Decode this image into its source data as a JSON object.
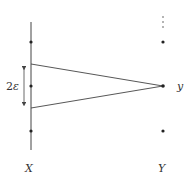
{
  "diagram": {
    "labels": {
      "left_axis": "X",
      "right_axis": "Y",
      "point": "y",
      "interval_coeff": "2",
      "interval_var": "ε"
    },
    "colors": {
      "stroke": "#444444",
      "dot": "#222222",
      "text": "#333333"
    },
    "left_axis_dots_y": [
      42,
      86,
      131
    ],
    "right_axis_dots_y": [
      42,
      86,
      131
    ],
    "interval": {
      "top_y": 64,
      "bottom_y": 108
    }
  }
}
